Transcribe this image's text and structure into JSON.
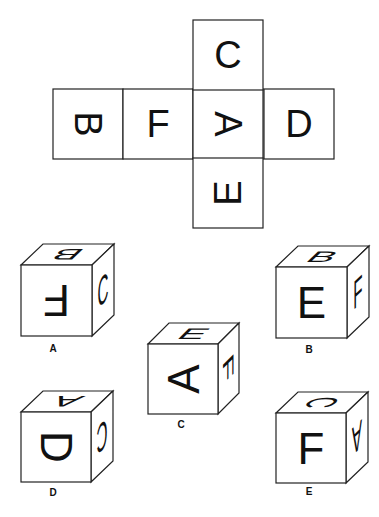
{
  "net": {
    "cell_size": 70,
    "cells": [
      {
        "id": "B",
        "letter": "B",
        "x": 53,
        "y": 89,
        "rotate": 90
      },
      {
        "id": "F",
        "letter": "F",
        "x": 123,
        "y": 89,
        "rotate": 0
      },
      {
        "id": "A",
        "letter": "A",
        "x": 193,
        "y": 89,
        "rotate": 90
      },
      {
        "id": "D",
        "letter": "D",
        "x": 264,
        "y": 89,
        "rotate": 0
      },
      {
        "id": "C",
        "letter": "C",
        "x": 193,
        "y": 20,
        "rotate": 0
      },
      {
        "id": "E",
        "letter": "E",
        "x": 193,
        "y": 158,
        "rotate": -90
      }
    ]
  },
  "options": [
    {
      "label": "A",
      "front": {
        "x": 21,
        "y": 265,
        "size": 71
      },
      "depth": {
        "dx": 22,
        "dy": -21
      },
      "faces": {
        "front": {
          "letter": "F",
          "rotate": 180
        },
        "top": {
          "letter": "B",
          "rotate": 180
        },
        "right": {
          "letter": "C",
          "rotate": 0
        }
      },
      "label_pos": {
        "x": 53,
        "y": 352
      }
    },
    {
      "label": "B",
      "front": {
        "x": 276,
        "y": 267,
        "size": 71
      },
      "depth": {
        "dx": 22,
        "dy": -21
      },
      "faces": {
        "front": {
          "letter": "E",
          "rotate": 0
        },
        "top": {
          "letter": "B",
          "rotate": 0
        },
        "right": {
          "letter": "F",
          "rotate": 0
        }
      },
      "label_pos": {
        "x": 309,
        "y": 353
      }
    },
    {
      "label": "C",
      "front": {
        "x": 148,
        "y": 344,
        "size": 70
      },
      "depth": {
        "dx": 21,
        "dy": -21
      },
      "faces": {
        "front": {
          "letter": "A",
          "rotate": -90
        },
        "top": {
          "letter": "E",
          "rotate": 0
        },
        "right": {
          "letter": "F",
          "rotate": 90
        }
      },
      "label_pos": {
        "x": 181,
        "y": 428
      }
    },
    {
      "label": "D",
      "front": {
        "x": 21,
        "y": 412,
        "size": 70
      },
      "depth": {
        "dx": 22,
        "dy": -21
      },
      "faces": {
        "front": {
          "letter": "D",
          "rotate": 90
        },
        "top": {
          "letter": "A",
          "rotate": 180
        },
        "right": {
          "letter": "C",
          "rotate": 180
        }
      },
      "label_pos": {
        "x": 53,
        "y": 496
      }
    },
    {
      "label": "E",
      "front": {
        "x": 276,
        "y": 413,
        "size": 70
      },
      "depth": {
        "dx": 22,
        "dy": -21
      },
      "faces": {
        "front": {
          "letter": "F",
          "rotate": 0
        },
        "top": {
          "letter": "C",
          "rotate": 90
        },
        "right": {
          "letter": "A",
          "rotate": 180
        }
      },
      "label_pos": {
        "x": 309,
        "y": 495
      }
    }
  ]
}
